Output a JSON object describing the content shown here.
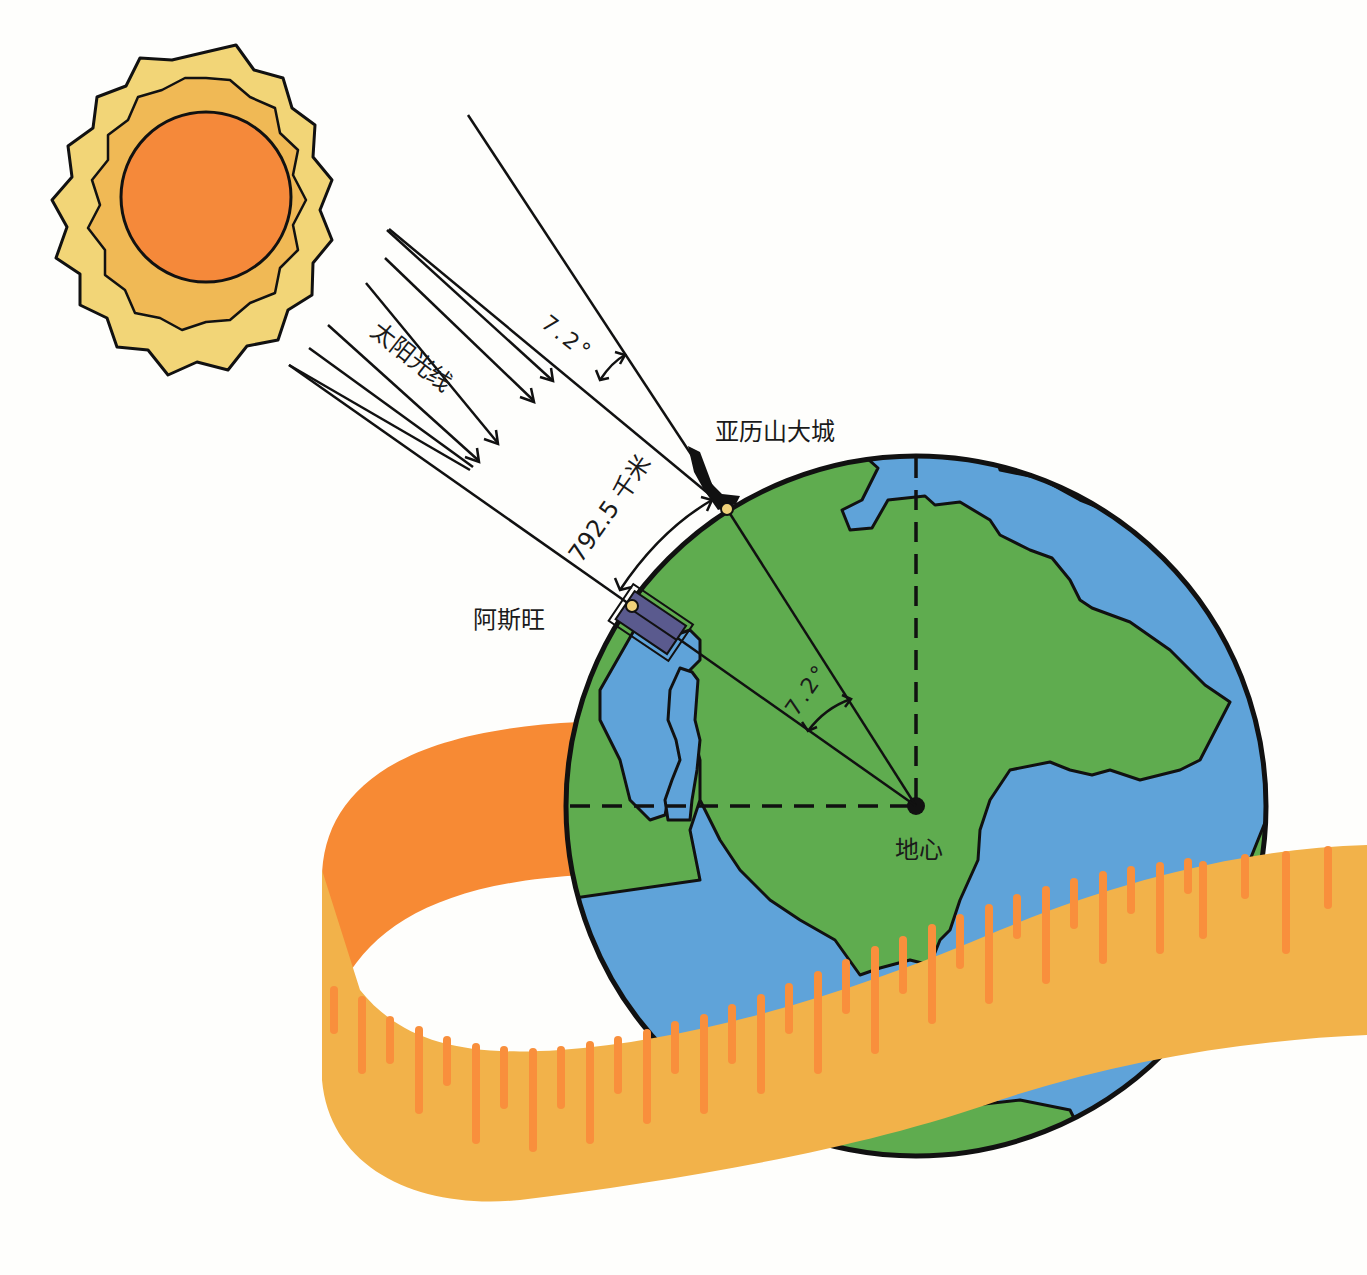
{
  "diagram": {
    "labels": {
      "sun_rays": "太阳光线",
      "angle_top": "7.2°",
      "distance": "792.5 千米",
      "alexandria": "亚历山大城",
      "syene": "阿斯旺",
      "angle_center": "7.2°",
      "earth_center": "地心"
    },
    "colors": {
      "background": "#fefefc",
      "sun_core": "#f5893a",
      "sun_inner_ring": "#f0b955",
      "sun_outer_ring": "#f2d577",
      "ocean": "#5fa3d9",
      "land": "#5fac4f",
      "ribbon_back": "#f78a34",
      "ribbon_front": "#f2b24a",
      "ribbon_ticks": "#f98f3c",
      "well": "#5a5a8e",
      "marker": "#f0d27a",
      "line": "#111111"
    }
  }
}
